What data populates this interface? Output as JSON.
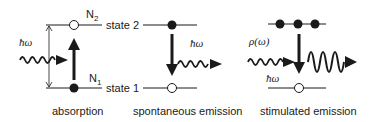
{
  "diagram": {
    "panels": [
      {
        "id": "absorption",
        "caption": "absorption",
        "upper_level_label": "N",
        "upper_level_sub": "2",
        "lower_level_label": "N",
        "lower_level_sub": "1",
        "photon_label": "ħω",
        "transition": "up"
      },
      {
        "id": "spontaneous",
        "caption": "spontaneous emission",
        "state_upper": "state 2",
        "state_lower": "state 1",
        "photon_label": "ħω",
        "transition": "down"
      },
      {
        "id": "stimulated",
        "caption": "stimulated emission",
        "input_label": "ρ(ω)",
        "photon_label": "ħω",
        "transition": "down"
      }
    ],
    "colors": {
      "ink": "#1a1a1a",
      "background": "#ffffff"
    }
  }
}
